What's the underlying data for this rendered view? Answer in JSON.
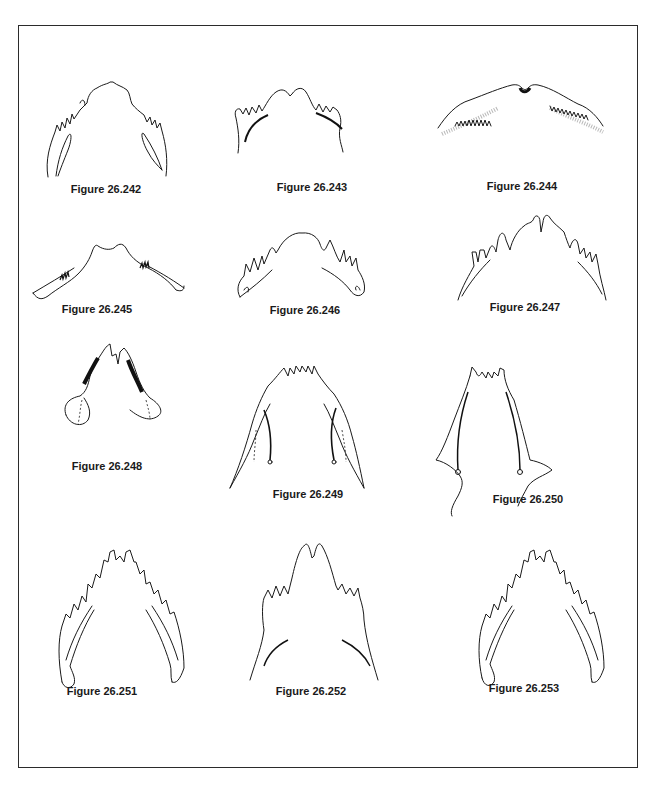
{
  "page": {
    "frame": {
      "border_color": "#2b2b2b"
    },
    "figures": [
      {
        "id": "26.242",
        "label": "Figure 26.242",
        "row": 1,
        "col": 1
      },
      {
        "id": "26.243",
        "label": "Figure 26.243",
        "row": 1,
        "col": 2
      },
      {
        "id": "26.244",
        "label": "Figure 26.244",
        "row": 1,
        "col": 3
      },
      {
        "id": "26.245",
        "label": "Figure 26.245",
        "row": 2,
        "col": 1
      },
      {
        "id": "26.246",
        "label": "Figure 26.246",
        "row": 2,
        "col": 2
      },
      {
        "id": "26.247",
        "label": "Figure 26.247",
        "row": 2,
        "col": 3
      },
      {
        "id": "26.248",
        "label": "Figure 26.248",
        "row": 3,
        "col": 1
      },
      {
        "id": "26.249",
        "label": "Figure 26.249",
        "row": 3,
        "col": 2
      },
      {
        "id": "26.250",
        "label": "Figure 26.250",
        "row": 3,
        "col": 3
      },
      {
        "id": "26.251",
        "label": "Figure 26.251",
        "row": 4,
        "col": 1
      },
      {
        "id": "26.252",
        "label": "Figure 26.252",
        "row": 4,
        "col": 2
      },
      {
        "id": "26.253",
        "label": "Figure 26.253",
        "row": 4,
        "col": 3
      }
    ]
  }
}
